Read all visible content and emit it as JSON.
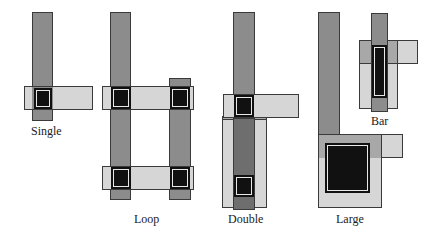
{
  "diagram": {
    "type": "layout-contact-structures",
    "colors": {
      "metal": "#d6d6d6",
      "poly": "#8c8c8c",
      "poly_dark": "#6e6e6e",
      "overlap": "#a8a8a8",
      "contact": "#111111",
      "outline": "#3a3a3a"
    },
    "structures": [
      {
        "id": "single",
        "label": "Single"
      },
      {
        "id": "loop",
        "label": "Loop"
      },
      {
        "id": "double",
        "label": "Double"
      },
      {
        "id": "large",
        "label": "Large"
      },
      {
        "id": "bar",
        "label": "Bar"
      }
    ]
  }
}
